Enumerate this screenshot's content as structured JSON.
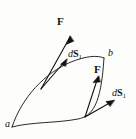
{
  "figure": {
    "kind": "physics-vector-diagram",
    "background_color": "#fdfdfc",
    "stroke_color": "#121212",
    "width": 136,
    "height": 139,
    "labels": {
      "force_top": "F",
      "force_right": "F",
      "ds_top_d": "d",
      "ds_top_s": "S",
      "ds_top_sub": "1",
      "ds_right_d": "d",
      "ds_right_s": "S",
      "ds_right_sub": "1",
      "point_a": "a",
      "point_b": "b"
    },
    "geometry": {
      "point_a": [
        12,
        127
      ],
      "point_b": [
        104,
        58
      ],
      "upper_curve": "M12,127 C22,96 46,72 72,62 C86,57 96,56 104,58",
      "lower_curve": "M12,127 C30,121 58,122 78,118 C92,115 100,108 104,58",
      "vertex_upper": [
        41,
        89
      ],
      "vertex_lower": [
        85,
        117
      ],
      "arrows": [
        {
          "name": "force-top",
          "from": [
            41,
            89
          ],
          "to": [
            70,
            36
          ]
        },
        {
          "name": "ds-top",
          "from": [
            41,
            89
          ],
          "to": [
            66,
            59
          ]
        },
        {
          "name": "force-right",
          "from": [
            85,
            117
          ],
          "to": [
            99,
            76
          ]
        },
        {
          "name": "ds-right",
          "from": [
            85,
            117
          ],
          "to": [
            114,
            100
          ]
        }
      ]
    }
  }
}
